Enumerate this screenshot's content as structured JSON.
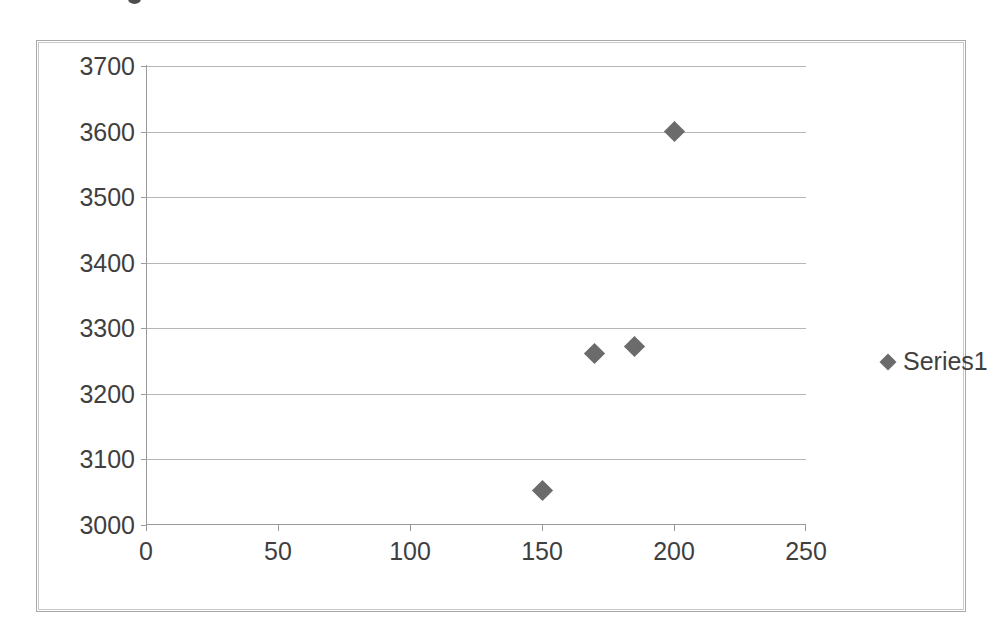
{
  "chart_data": {
    "type": "scatter",
    "title": "",
    "xlabel": "",
    "ylabel": "",
    "xlim": [
      0,
      250
    ],
    "ylim": [
      3000,
      3700
    ],
    "xticks": [
      0,
      50,
      100,
      150,
      200,
      250
    ],
    "yticks": [
      3000,
      3100,
      3200,
      3300,
      3400,
      3500,
      3600,
      3700
    ],
    "xtick_labels": [
      "0",
      "50",
      "100",
      "150",
      "200",
      "250"
    ],
    "ytick_labels": [
      "3000",
      "3100",
      "3200",
      "3300",
      "3400",
      "3500",
      "3600",
      "3700"
    ],
    "grid": "horizontal",
    "legend_position": "right",
    "marker_color": "#6b6b6b",
    "marker_shape": "diamond",
    "series": [
      {
        "name": "Series1",
        "points": [
          {
            "x": 150,
            "y": 3052
          },
          {
            "x": 170,
            "y": 3262
          },
          {
            "x": 185,
            "y": 3272
          },
          {
            "x": 200,
            "y": 3600
          }
        ]
      }
    ]
  },
  "legend": {
    "entries": [
      {
        "label": "Series1",
        "marker": "diamond-marker-icon",
        "color": "#6b6b6b"
      }
    ]
  },
  "frame": {
    "border_color": "#a9a9a9",
    "background": "#ffffff"
  }
}
